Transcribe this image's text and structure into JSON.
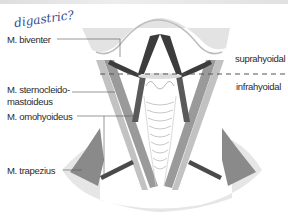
{
  "annotation": {
    "handwritten_note": "digastric?"
  },
  "labels": {
    "biventer": "M. biventer",
    "sternocleidomastoideus_line1": "M. sternocleido-",
    "sternocleidomastoideus_line2": "mastoideus",
    "omohyoideus": "M. omohyoideus",
    "trapezius": "M. trapezius",
    "suprahyoidal": "suprahyoidal",
    "infrahyoidal": "infrahyoidal"
  },
  "colors": {
    "background": "#ffffff",
    "skin_shade": "#e4e4e4",
    "muscle_dark": "#3c3c3c",
    "muscle_mid": "#8a8a8a",
    "muscle_light": "#b4b4b4",
    "label_text": "#2a2a2a",
    "handwriting": "#3a4a8a"
  }
}
